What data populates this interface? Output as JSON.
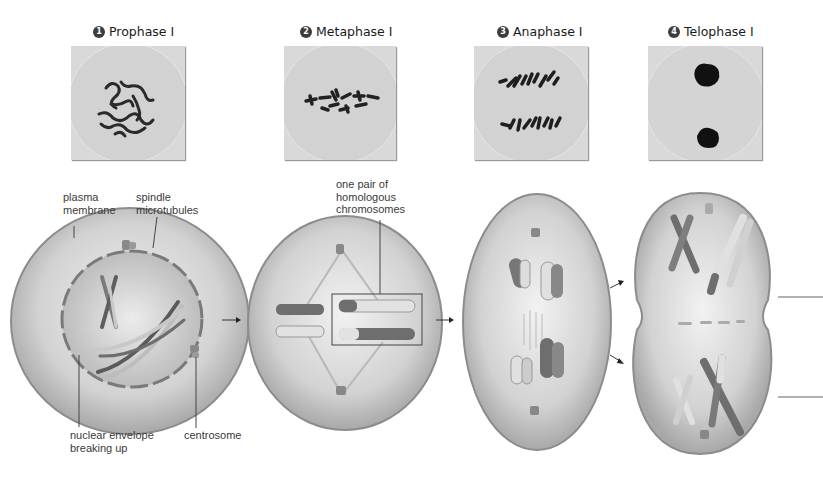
{
  "stages": [
    {
      "number": "1",
      "title": "Prophase I"
    },
    {
      "number": "2",
      "title": "Metaphase I"
    },
    {
      "number": "3",
      "title": "Anaphase I"
    },
    {
      "number": "4",
      "title": "Telophase I"
    }
  ],
  "labels": {
    "plasma_membrane": [
      "plasma",
      "membrane"
    ],
    "spindle_microtubules": [
      "spindle",
      "microtubules"
    ],
    "homologous_pair": [
      "one pair of",
      "homologous",
      "chromosomes"
    ],
    "nuclear_envelope": [
      "nuclear envelope",
      "breaking up"
    ],
    "centrosome": [
      "centrosome"
    ]
  },
  "colors": {
    "cell_fill": "#d4d4d4",
    "cell_edge": "#8c8c8c",
    "chromosome_dark": "#6a6a6a",
    "chromosome_light": "#e2e2e2",
    "micrograph_bg": "#d9d9d9",
    "text": "#3a3a3a"
  }
}
